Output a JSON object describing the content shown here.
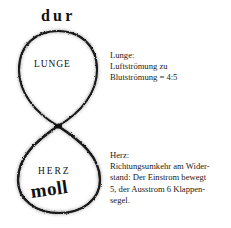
{
  "figure": {
    "name": "lemniscate-diagram",
    "upper_loop_label": "LUNGE",
    "lower_loop_label": "HERZ",
    "upper_mode_label": "dur",
    "lower_mode_label": "moll",
    "ink_color": "#1a1a1a",
    "background_color": "#ffffff"
  },
  "notes": {
    "lunge": {
      "title": "Lunge:",
      "lines": [
        "Luftströmung zu",
        "Blutströmung = 4:5"
      ]
    },
    "herz": {
      "title": "Herz:",
      "lines": [
        "Richtungsumkehr am Wider-",
        "stand: Der Einstrom bewegt",
        "5, der Ausstrom 6 Klappen-",
        "segel."
      ]
    }
  }
}
